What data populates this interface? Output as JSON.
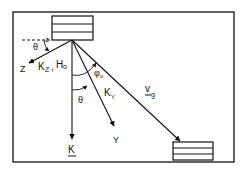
{
  "diagram": {
    "labels": {
      "theta_top": "θ",
      "z_small": "z",
      "z_axis": "Z",
      "kz_h0": "K",
      "kz_sub": "Z",
      "h0": "H",
      "h0_sub": "o",
      "phi0": "φ",
      "phi0_sub": "o",
      "theta_mid": "θ",
      "ky": "K",
      "ky_sub": "Y",
      "y_axis": "Y",
      "k_vec": "K",
      "vg": "v",
      "vg_sub": "g"
    },
    "colors": {
      "ink": "#111111",
      "background": "#ffffff"
    }
  }
}
